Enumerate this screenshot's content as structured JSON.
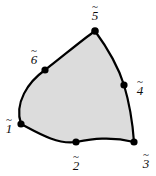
{
  "figure": {
    "background_color": "#ffffff",
    "fill_color": "#dcdcdc",
    "stroke_color": "#000000",
    "node_color": "#000000",
    "accent_symbol": "~"
  },
  "element": {
    "outline_path": "M 21 124 C 14 103, 28 82, 45 70 C 62 57, 82 40, 95 31 C 106 46, 118 66, 124 85 C 130 105, 133 128, 134 142 C 110 136, 92 139, 76 142 C 58 145, 38 133, 21 124 Z",
    "vertex_node_ids": [
      "1",
      "3",
      "5"
    ],
    "midside_node_ids": [
      "2",
      "4",
      "6"
    ]
  },
  "nodes": [
    {
      "id": "1",
      "label_number": "1",
      "accent": "~",
      "type": "vertex",
      "cx": 21,
      "cy": 124,
      "r": 3.6,
      "label_x": 9,
      "label_y": 126
    },
    {
      "id": "2",
      "label_number": "2",
      "accent": "~",
      "type": "midside",
      "cx": 76,
      "cy": 142,
      "r": 3.6,
      "label_x": 76,
      "label_y": 163
    },
    {
      "id": "3",
      "label_number": "3",
      "accent": "~",
      "type": "vertex",
      "cx": 134,
      "cy": 142,
      "r": 3.6,
      "label_x": 146,
      "label_y": 161
    },
    {
      "id": "4",
      "label_number": "4",
      "accent": "~",
      "type": "midside",
      "cx": 124,
      "cy": 85,
      "r": 3.6,
      "label_x": 140,
      "label_y": 88
    },
    {
      "id": "5",
      "label_number": "5",
      "accent": "~",
      "type": "vertex",
      "cx": 95,
      "cy": 31,
      "r": 3.8,
      "label_x": 95,
      "label_y": 13
    },
    {
      "id": "6",
      "label_number": "6",
      "accent": "~",
      "type": "midside",
      "cx": 45,
      "cy": 70,
      "r": 3.6,
      "label_x": 34,
      "label_y": 57
    }
  ]
}
